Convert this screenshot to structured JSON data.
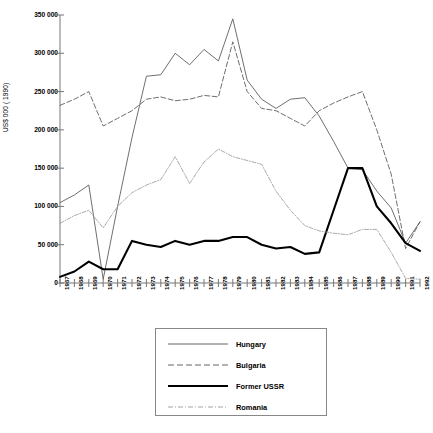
{
  "chart_data": {
    "type": "line",
    "title": "",
    "subtitle": "",
    "xlabel": "",
    "ylabel": "US$ 000 ( 1990)",
    "grid": false,
    "legend_position": "bottom",
    "xlim": [
      1967,
      1992
    ],
    "ylim": [
      0,
      350000
    ],
    "ytick_labels": [
      "0",
      "50 000",
      "100 000",
      "150 000",
      "200 000",
      "250 000",
      "300 000",
      "350 000"
    ],
    "ytick_values": [
      0,
      50000,
      100000,
      150000,
      200000,
      250000,
      300000,
      350000
    ],
    "categories": [
      "1967",
      "1968",
      "1969",
      "1970",
      "1971",
      "1972",
      "1973",
      "1974",
      "1975",
      "1976",
      "1977",
      "1978",
      "1979",
      "1980",
      "1981",
      "1982",
      "1983",
      "1984",
      "1985",
      "1986",
      "1987",
      "1988",
      "1989",
      "1990",
      "1991",
      "1992"
    ],
    "series": [
      {
        "name": "Hungary",
        "style": "solid-thin",
        "color": "#555555",
        "values": [
          105000,
          115000,
          128000,
          5000,
          100000,
          190000,
          270000,
          272000,
          300000,
          285000,
          305000,
          290000,
          345000,
          265000,
          240000,
          228000,
          240000,
          242000,
          218000,
          185000,
          150000,
          148000,
          120000,
          98000,
          52000,
          80000
        ]
      },
      {
        "name": "Bulgaria",
        "style": "dashed",
        "color": "#555555",
        "values": [
          232000,
          240000,
          250000,
          205000,
          215000,
          225000,
          240000,
          243000,
          238000,
          240000,
          245000,
          243000,
          315000,
          250000,
          228000,
          225000,
          215000,
          205000,
          225000,
          235000,
          243000,
          250000,
          200000,
          142000,
          45000,
          80000
        ]
      },
      {
        "name": "Former USSR",
        "style": "solid-thick",
        "color": "#000000",
        "values": [
          8000,
          15000,
          28000,
          18000,
          18000,
          55000,
          50000,
          47000,
          55000,
          50000,
          55000,
          55000,
          60000,
          60000,
          50000,
          45000,
          47000,
          38000,
          40000,
          95000,
          150000,
          150000,
          100000,
          78000,
          52000,
          42000
        ]
      },
      {
        "name": "Romania",
        "style": "dash-dot",
        "color": "#999999",
        "values": [
          78000,
          88000,
          95000,
          72000,
          100000,
          118000,
          128000,
          135000,
          165000,
          130000,
          158000,
          175000,
          165000,
          160000,
          155000,
          120000,
          95000,
          75000,
          68000,
          65000,
          63000,
          70000,
          70000,
          40000,
          6000,
          5000
        ]
      }
    ]
  },
  "legend": {
    "items": [
      {
        "label": "Hungary"
      },
      {
        "label": "Bulgaria"
      },
      {
        "label": "Former USSR"
      },
      {
        "label": "Romania"
      }
    ]
  }
}
